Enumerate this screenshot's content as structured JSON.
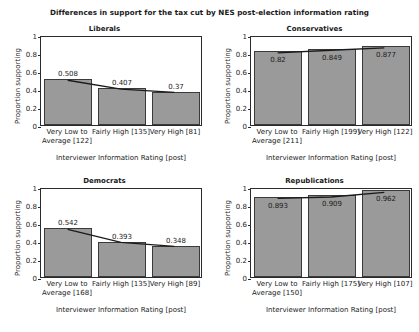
{
  "chart_data": {
    "type": "bar",
    "title": "Differences in support for the tax cut by NES post-election information rating",
    "xlabel": "Interviewer Information Rating [post]",
    "ylabel": "Proportion supporting",
    "ylim": [
      0,
      1
    ],
    "yticks": [
      "0",
      "0.2",
      "0.4",
      "0.6",
      "0.8",
      "1"
    ],
    "grid": false,
    "legend": "none",
    "overlay": "trend line connecting bar tops",
    "panel_layout": "2x2",
    "categories": [
      "Very Low to Average",
      "Fairly High",
      "Very High"
    ],
    "panels": [
      {
        "name": "Liberals",
        "label_position": "above",
        "categories": [
          "Very Low to Average [122]",
          "Fairly High [135]",
          "Very High [81]"
        ],
        "counts": [
          122,
          135,
          81
        ],
        "values": [
          0.508,
          0.407,
          0.37
        ],
        "value_labels": [
          "0.508",
          "0.407",
          "0.37"
        ]
      },
      {
        "name": "Conservatives",
        "label_position": "inside",
        "categories": [
          "Very Low to Average [211]",
          "Fairly High [199]",
          "Very High [122]"
        ],
        "counts": [
          211,
          199,
          122
        ],
        "values": [
          0.82,
          0.849,
          0.877
        ],
        "value_labels": [
          "0.82",
          "0.849",
          "0.877"
        ]
      },
      {
        "name": "Democrats",
        "label_position": "above",
        "categories": [
          "Very Low to Average [168]",
          "Fairly High [135]",
          "Very High [89]"
        ],
        "counts": [
          168,
          135,
          89
        ],
        "values": [
          0.542,
          0.393,
          0.348
        ],
        "value_labels": [
          "0.542",
          "0.393",
          "0.348"
        ]
      },
      {
        "name": "Republications",
        "label_position": "inside",
        "categories": [
          "Very Low to Average [150]",
          "Fairly High [175]",
          "Very High [107]"
        ],
        "counts": [
          150,
          175,
          107
        ],
        "values": [
          0.893,
          0.909,
          0.962
        ],
        "value_labels": [
          "0.893",
          "0.909",
          "0.962"
        ]
      }
    ],
    "colors": {
      "bar_fill": "#9a9a9a",
      "bar_edge": "#3a3a3a",
      "trend_line": "#1a1a1a",
      "axis": "#2b2b2b",
      "background": "#ffffff",
      "text": "#1a1a1a"
    }
  }
}
